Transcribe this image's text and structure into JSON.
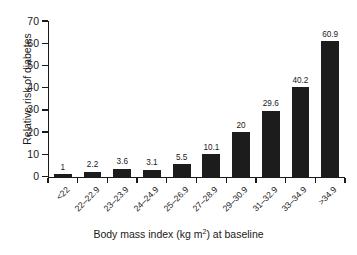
{
  "chart_data": {
    "type": "bar",
    "title": "",
    "xlabel": "Body mass index (kg m2) at baseline",
    "xlabel_prefix": "Body mass index (kg m",
    "xlabel_sup": "2",
    "xlabel_suffix": ") at baseline",
    "ylabel": "Relative risk of diabetes",
    "categories": [
      "<22",
      "22–22.9",
      "23–23.9",
      "24–24.9",
      "25–26.9",
      "27–28.9",
      "29–30.9",
      "31–32.9",
      "33–34.9",
      ">34.9"
    ],
    "values": [
      1,
      2.2,
      3.6,
      3.1,
      5.5,
      10.1,
      20,
      29.6,
      40.2,
      60.9
    ],
    "value_labels": [
      "1",
      "2.2",
      "3.6",
      "3.1",
      "5.5",
      "10.1",
      "20",
      "29.6",
      "40.2",
      "60.9"
    ],
    "ylim": [
      0,
      70
    ],
    "yticks": [
      0,
      10,
      20,
      30,
      40,
      50,
      60,
      70
    ],
    "ytick_labels": [
      "0",
      "10",
      "20",
      "30",
      "40",
      "50",
      "60",
      "70"
    ],
    "grid": false,
    "legend": false,
    "bar_color": "#1c1c1c",
    "axis_color": "#1a1a1a",
    "background": "#ffffff"
  }
}
